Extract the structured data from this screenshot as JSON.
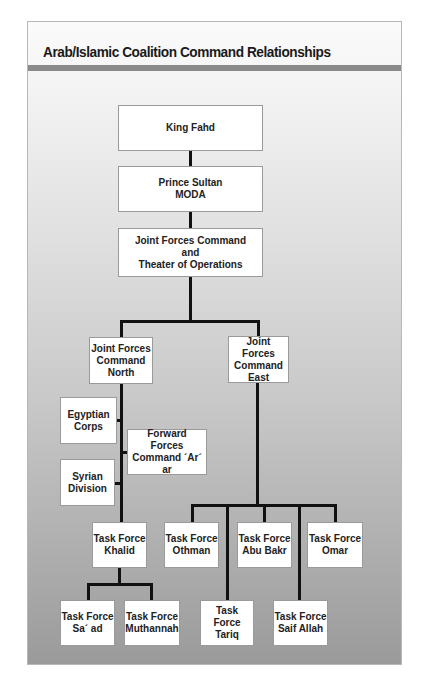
{
  "title": "Arab/Islamic Coalition Command Relationships",
  "nodes": {
    "king_fahd": "King Fahd",
    "prince_sultan": "Prince Sultan\nMODA",
    "jfc": "Joint Forces Command\nand\nTheater of Operations",
    "jfc_north": "Joint Forces\nCommand\nNorth",
    "jfc_east": "Joint Forces\nCommand\nEast",
    "egyptian_corps": "Egyptian\nCorps",
    "syrian_division": "Syrian\nDivision",
    "forward_forces": "Forward\nForces\nCommand ´Ar´ ar",
    "tf_khalid": "Task Force\nKhalid",
    "tf_saad": "Task Force\nSa´ ad",
    "tf_muthannah": "Task Force\nMuthannah",
    "tf_othman": "Task Force\nOthman",
    "tf_abu_bakr": "Task Force\nAbu Bakr",
    "tf_omar": "Task Force\nOmar",
    "tf_tariq": "Task Force\nTariq",
    "tf_saif_allah": "Task Force\nSaif Allah"
  },
  "colors": {
    "title_bar": "#8a8a8a",
    "connector": "#111111",
    "box_fill": "#ffffff"
  }
}
